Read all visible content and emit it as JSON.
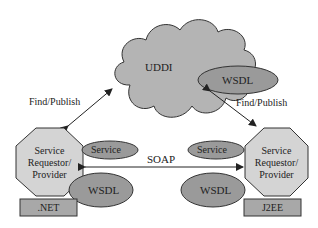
{
  "diagram": {
    "type": "web-services-architecture",
    "registry": {
      "label": "UDDI",
      "attached": "WSDL"
    },
    "left_node": {
      "label_lines": [
        "Service",
        "Requestor/",
        "Provider"
      ],
      "platform": ".NET",
      "service": "Service",
      "wsdl": "WSDL"
    },
    "right_node": {
      "label_lines": [
        "Service",
        "Requestor/",
        "Provider"
      ],
      "platform": "J2EE",
      "service": "Service",
      "wsdl": "WSDL"
    },
    "edges": {
      "left_registry": "Find/Publish",
      "right_registry": "Find/Publish",
      "protocol": "SOAP"
    },
    "colors": {
      "cloud": "#b4b4b4",
      "octagon": "#d4d4d4",
      "ellipse": "#9a9a9a",
      "platform_box": "#a8a8a8",
      "stroke": "#333333"
    }
  }
}
